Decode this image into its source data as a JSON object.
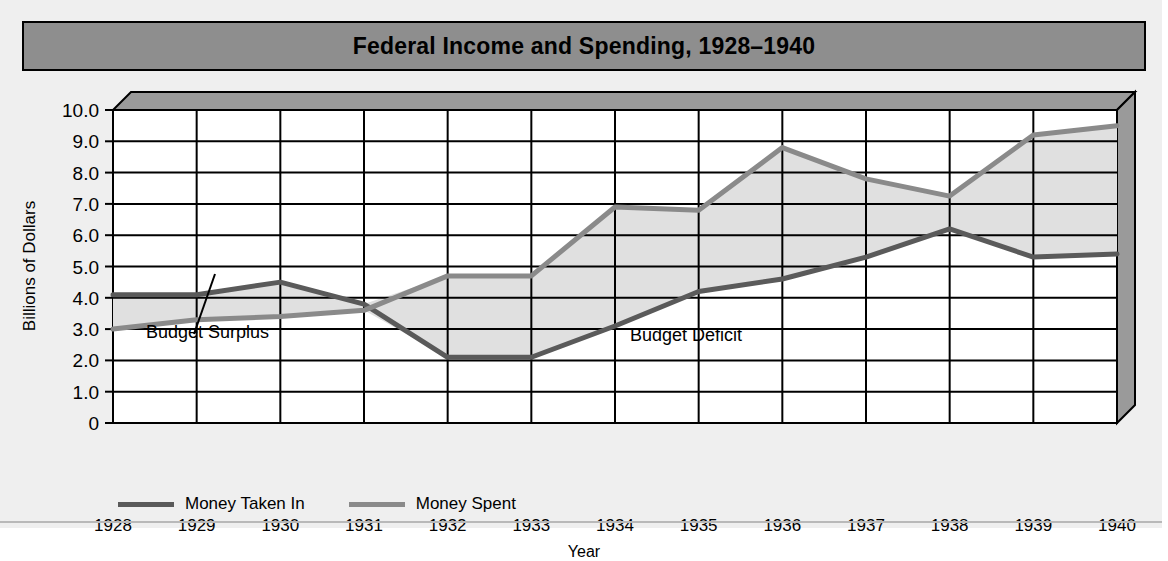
{
  "header": {
    "title": "Federal Income and Spending, 1928–1940"
  },
  "annotations": {
    "surplus": "Budget Surplus",
    "deficit": "Budget Deficit"
  },
  "legend": {
    "items": [
      {
        "label": "Money Taken In",
        "color": "#5a5a5a"
      },
      {
        "label": "Money Spent",
        "color": "#8a8a8a"
      }
    ]
  },
  "colors": {
    "title_band": "#8e8e8e",
    "page_background": "#efefef",
    "plot_background": "#ffffff",
    "grid": "#000000",
    "shaded_region": "#e0e0e0",
    "bevel": "#9a9a9a",
    "income_line": "#5a5a5a",
    "spending_line": "#8a8a8a"
  },
  "chart_data": {
    "type": "line",
    "title": "Federal Income and Spending, 1928–1940",
    "xlabel": "Year",
    "ylabel": "Billions of Dollars",
    "categories": [
      "1928",
      "1929",
      "1930",
      "1931",
      "1932",
      "1933",
      "1934",
      "1935",
      "1936",
      "1937",
      "1938",
      "1939",
      "1940"
    ],
    "x_tick_labels": [
      "1928",
      "1929",
      "1930",
      "1931",
      "1932",
      "1933",
      "1934",
      "1935",
      "1936",
      "1937",
      "1938",
      "1939",
      "1940"
    ],
    "y_tick_labels": [
      "10.0",
      "9.0",
      "8.0",
      "7.0",
      "6.0",
      "5.0",
      "4.0",
      "3.0",
      "2.0",
      "1.0",
      "0"
    ],
    "ylim": [
      0,
      10
    ],
    "y_tick_values": [
      10,
      9,
      8,
      7,
      6,
      5,
      4,
      3,
      2,
      1,
      0
    ],
    "grid": true,
    "legend_position": "bottom-left",
    "series": [
      {
        "name": "Money Taken In",
        "color": "#5a5a5a",
        "values": [
          4.1,
          4.1,
          4.5,
          3.8,
          2.1,
          2.1,
          3.1,
          4.2,
          4.6,
          5.3,
          6.2,
          5.3,
          5.4
        ]
      },
      {
        "name": "Money Spent",
        "color": "#8a8a8a",
        "values": [
          3.0,
          3.3,
          3.4,
          3.6,
          4.7,
          4.7,
          6.9,
          6.8,
          8.8,
          7.8,
          7.25,
          9.2,
          9.5
        ]
      }
    ],
    "annotations": [
      {
        "text": "Budget Surplus",
        "note": "region where Money Taken In exceeds Money Spent, 1928–1931"
      },
      {
        "text": "Budget Deficit",
        "note": "region where Money Spent exceeds Money Taken In, 1931–1940"
      }
    ]
  }
}
